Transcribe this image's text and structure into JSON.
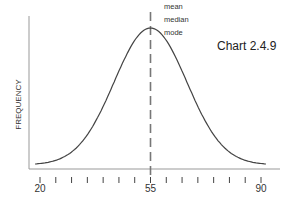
{
  "chart_data": {
    "type": "line",
    "title": "Chart 2.4.9",
    "xlabel": "",
    "ylabel": "FREQUENCY",
    "xlim": [
      18,
      93
    ],
    "x_ticks": [
      20,
      25,
      30,
      35,
      40,
      45,
      50,
      55,
      60,
      65,
      70,
      75,
      80,
      85,
      90
    ],
    "x_tick_labels": [
      {
        "value": 20,
        "label": "20"
      },
      {
        "value": 55,
        "label": "55"
      },
      {
        "value": 90,
        "label": "90"
      }
    ],
    "series": [
      {
        "name": "normal distribution",
        "distribution": "normal",
        "mean": 55,
        "sd": 11,
        "x_range": [
          20,
          90
        ]
      }
    ],
    "reference_line": {
      "x": 55,
      "style": "dashed",
      "labels": [
        "mean",
        "median",
        "mode"
      ]
    },
    "grid": false,
    "legend": "none"
  }
}
